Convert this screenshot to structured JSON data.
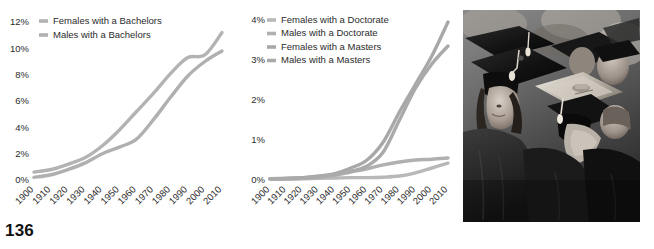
{
  "page": {
    "number": "136"
  },
  "photo": {
    "alt_name": "graduation-ceremony-photo",
    "description": "Grayscale photograph of graduates seated in caps and gowns"
  },
  "colors": {
    "line_light": "#b3b3b3",
    "line_mid": "#a6a6a6",
    "line_dark": "#999999",
    "text": "#2b2b2b"
  },
  "chart_data": [
    {
      "type": "line",
      "id": "bachelors",
      "title": "",
      "xlabel": "",
      "ylabel": "",
      "grid": false,
      "legend_position": "top-left",
      "xlim": [
        1900,
        2010
      ],
      "ylim": [
        0,
        12
      ],
      "ytick_labels": [
        "12%",
        "10%",
        "8%",
        "6%",
        "4%",
        "2%",
        "0%"
      ],
      "ytick_values": [
        12,
        10,
        8,
        6,
        4,
        2,
        0
      ],
      "categories": [
        1900,
        1910,
        1920,
        1930,
        1940,
        1950,
        1960,
        1970,
        1980,
        1990,
        2000,
        2010
      ],
      "xtick_labels": [
        "1900",
        "1910",
        "1920",
        "1930",
        "1940",
        "1950",
        "1960",
        "1970",
        "1980",
        "1990",
        "2000",
        "2010"
      ],
      "series": [
        {
          "name": "Females with a Bachelors",
          "color": "#b3b3b3",
          "values": [
            0.6,
            0.8,
            1.2,
            1.7,
            2.6,
            3.8,
            5.2,
            6.6,
            8.1,
            9.3,
            9.5,
            11.2
          ]
        },
        {
          "name": "Males with a Bachelors",
          "color": "#b0b0b0",
          "values": [
            0.2,
            0.4,
            0.8,
            1.3,
            2.0,
            2.5,
            3.1,
            4.6,
            6.3,
            7.9,
            9.0,
            9.8
          ]
        }
      ]
    },
    {
      "type": "line",
      "id": "advanced-degrees",
      "title": "",
      "xlabel": "",
      "ylabel": "",
      "grid": false,
      "legend_position": "top-left",
      "xlim": [
        1900,
        2010
      ],
      "ylim": [
        0,
        4
      ],
      "ytick_labels": [
        "4%",
        "3%",
        "2%",
        "1%",
        "0%"
      ],
      "ytick_values": [
        4,
        3,
        2,
        1,
        0
      ],
      "categories": [
        1900,
        1910,
        1920,
        1930,
        1940,
        1950,
        1960,
        1970,
        1980,
        1990,
        2000,
        2010
      ],
      "xtick_labels": [
        "1900",
        "1910",
        "1920",
        "1930",
        "1940",
        "1950",
        "1960",
        "1970",
        "1980",
        "1990",
        "2000",
        "2010"
      ],
      "series": [
        {
          "name": "Females with a Doctorate",
          "color": "#b8b8b8",
          "values": [
            0.02,
            0.02,
            0.03,
            0.04,
            0.05,
            0.06,
            0.06,
            0.07,
            0.1,
            0.18,
            0.3,
            0.42
          ]
        },
        {
          "name": "Males with a Doctorate",
          "color": "#b0b0b0",
          "values": [
            0.03,
            0.04,
            0.06,
            0.08,
            0.12,
            0.2,
            0.28,
            0.38,
            0.45,
            0.5,
            0.52,
            0.55
          ]
        },
        {
          "name": "Females with a Masters",
          "color": "#a8a8a8",
          "values": [
            0.03,
            0.04,
            0.06,
            0.1,
            0.16,
            0.3,
            0.5,
            0.95,
            1.7,
            2.4,
            3.1,
            3.95
          ]
        },
        {
          "name": "Males with a Masters",
          "color": "#aaaaaa",
          "values": [
            0.03,
            0.04,
            0.05,
            0.08,
            0.14,
            0.22,
            0.35,
            0.7,
            1.5,
            2.3,
            2.9,
            3.35
          ]
        }
      ]
    }
  ]
}
